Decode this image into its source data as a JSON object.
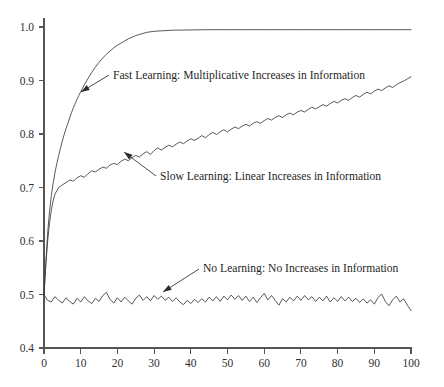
{
  "chart_data": {
    "type": "line",
    "title": "",
    "subtitle": "",
    "xlabel": "",
    "ylabel": "",
    "xlim": [
      0,
      100
    ],
    "ylim": [
      0.4,
      1.0
    ],
    "grid": false,
    "legend_position": "inline-annotations",
    "xticks": [
      0,
      10,
      20,
      30,
      40,
      50,
      60,
      70,
      80,
      90,
      100
    ],
    "xtick_labels": [
      "0",
      "10",
      "20",
      "30",
      "40",
      "50",
      "60",
      "70",
      "80",
      "90",
      "100"
    ],
    "yticks": [
      0.4,
      0.5,
      0.6,
      0.7,
      0.8,
      0.9,
      1.0
    ],
    "ytick_labels": [
      "0.4",
      "0.5",
      "0.6",
      "0.7",
      "0.8",
      "0.9",
      "1.0"
    ],
    "line_color": "#3a3a3a",
    "axis_color": "#555555",
    "background": "#ffffff",
    "series": [
      {
        "name": "Fast Learning: Multiplicative Increases in Information",
        "annotation": "Fast Learning: Multiplicative Increases in Information",
        "x": [
          0,
          0.5,
          1,
          1.5,
          2,
          2.5,
          3,
          3.5,
          4,
          4.5,
          5,
          5.5,
          6,
          6.5,
          7,
          7.5,
          8,
          8.5,
          9,
          9.5,
          10,
          11,
          12,
          13,
          14,
          15,
          16,
          17,
          18,
          19,
          20,
          21,
          22,
          23,
          24,
          25,
          26,
          27,
          28,
          30,
          35,
          40,
          45,
          50,
          55,
          60,
          65,
          70,
          75,
          80,
          85,
          90,
          95,
          100
        ],
        "y": [
          0.5,
          0.56,
          0.615,
          0.655,
          0.685,
          0.708,
          0.728,
          0.745,
          0.76,
          0.774,
          0.787,
          0.799,
          0.81,
          0.82,
          0.83,
          0.84,
          0.849,
          0.857,
          0.865,
          0.872,
          0.879,
          0.892,
          0.904,
          0.915,
          0.925,
          0.934,
          0.942,
          0.949,
          0.955,
          0.961,
          0.966,
          0.97,
          0.974,
          0.978,
          0.981,
          0.984,
          0.986,
          0.988,
          0.99,
          0.992,
          0.994,
          0.9945,
          0.995,
          0.995,
          0.995,
          0.995,
          0.995,
          0.995,
          0.995,
          0.995,
          0.995,
          0.995,
          0.995,
          0.995
        ]
      },
      {
        "name": "Slow Learning: Linear Increases in Information",
        "annotation": "Slow Learning: Linear Increases in Information",
        "x": [
          0,
          0.5,
          1,
          1.5,
          2,
          2.5,
          3,
          4,
          5,
          6,
          7,
          8,
          9,
          10,
          11,
          12,
          13,
          14,
          15,
          16,
          17,
          18,
          19,
          20,
          21,
          22,
          23,
          24,
          25,
          26,
          27,
          28,
          29,
          30,
          31,
          32,
          33,
          34,
          35,
          36,
          37,
          38,
          39,
          40,
          41,
          42,
          43,
          44,
          45,
          46,
          47,
          48,
          49,
          50,
          51,
          52,
          53,
          54,
          55,
          56,
          57,
          58,
          59,
          60,
          61,
          62,
          63,
          64,
          65,
          66,
          67,
          68,
          69,
          70,
          71,
          72,
          73,
          74,
          75,
          76,
          77,
          78,
          79,
          80,
          81,
          82,
          83,
          84,
          85,
          86,
          87,
          88,
          89,
          90,
          91,
          92,
          93,
          94,
          95,
          96,
          97,
          98,
          99,
          100
        ],
        "y": [
          0.5,
          0.556,
          0.6,
          0.633,
          0.658,
          0.675,
          0.688,
          0.7,
          0.705,
          0.709,
          0.714,
          0.712,
          0.718,
          0.722,
          0.719,
          0.726,
          0.731,
          0.729,
          0.734,
          0.738,
          0.736,
          0.742,
          0.745,
          0.743,
          0.749,
          0.753,
          0.75,
          0.756,
          0.76,
          0.757,
          0.763,
          0.767,
          0.762,
          0.769,
          0.774,
          0.77,
          0.775,
          0.779,
          0.776,
          0.781,
          0.785,
          0.782,
          0.787,
          0.791,
          0.788,
          0.792,
          0.797,
          0.793,
          0.799,
          0.803,
          0.799,
          0.804,
          0.808,
          0.804,
          0.809,
          0.813,
          0.81,
          0.815,
          0.818,
          0.815,
          0.82,
          0.823,
          0.82,
          0.825,
          0.829,
          0.826,
          0.831,
          0.834,
          0.831,
          0.836,
          0.839,
          0.836,
          0.841,
          0.844,
          0.841,
          0.846,
          0.85,
          0.847,
          0.851,
          0.855,
          0.852,
          0.857,
          0.861,
          0.858,
          0.863,
          0.866,
          0.863,
          0.868,
          0.872,
          0.869,
          0.874,
          0.878,
          0.875,
          0.88,
          0.884,
          0.881,
          0.886,
          0.89,
          0.887,
          0.892,
          0.896,
          0.899,
          0.903,
          0.907
        ]
      },
      {
        "name": "No Learning: No Increases in Information",
        "annotation": "No Learning: No Increases in Information",
        "x": [
          0,
          1,
          2,
          3,
          4,
          5,
          6,
          7,
          8,
          9,
          10,
          11,
          12,
          13,
          14,
          15,
          16,
          17,
          18,
          19,
          20,
          21,
          22,
          23,
          24,
          25,
          26,
          27,
          28,
          29,
          30,
          31,
          32,
          33,
          34,
          35,
          36,
          37,
          38,
          39,
          40,
          41,
          42,
          43,
          44,
          45,
          46,
          47,
          48,
          49,
          50,
          51,
          52,
          53,
          54,
          55,
          56,
          57,
          58,
          59,
          60,
          61,
          62,
          63,
          64,
          65,
          66,
          67,
          68,
          69,
          70,
          71,
          72,
          73,
          74,
          75,
          76,
          77,
          78,
          79,
          80,
          81,
          82,
          83,
          84,
          85,
          86,
          87,
          88,
          89,
          90,
          91,
          92,
          93,
          94,
          95,
          96,
          97,
          98,
          99,
          100
        ],
        "y": [
          0.5,
          0.489,
          0.486,
          0.496,
          0.489,
          0.484,
          0.494,
          0.487,
          0.482,
          0.493,
          0.486,
          0.496,
          0.488,
          0.483,
          0.493,
          0.487,
          0.498,
          0.504,
          0.491,
          0.484,
          0.494,
          0.486,
          0.495,
          0.488,
          0.482,
          0.493,
          0.499,
          0.489,
          0.496,
          0.488,
          0.498,
          0.491,
          0.497,
          0.489,
          0.495,
          0.487,
          0.494,
          0.486,
          0.481,
          0.489,
          0.483,
          0.491,
          0.485,
          0.492,
          0.486,
          0.495,
          0.488,
          0.496,
          0.487,
          0.497,
          0.49,
          0.499,
          0.491,
          0.498,
          0.489,
          0.497,
          0.487,
          0.495,
          0.485,
          0.494,
          0.502,
          0.49,
          0.498,
          0.489,
          0.48,
          0.492,
          0.486,
          0.495,
          0.488,
          0.497,
          0.489,
          0.498,
          0.49,
          0.496,
          0.487,
          0.495,
          0.488,
          0.497,
          0.486,
          0.494,
          0.487,
          0.496,
          0.488,
          0.495,
          0.487,
          0.493,
          0.485,
          0.492,
          0.484,
          0.49,
          0.482,
          0.494,
          0.501,
          0.487,
          0.479,
          0.49,
          0.497,
          0.486,
          0.492,
          0.48,
          0.47
        ]
      }
    ],
    "annotations": [
      {
        "id": "fast-learning-annotation",
        "text": "Fast Learning: Multiplicative Increases in Information",
        "text_x": 113,
        "text_y": 79,
        "leader_from_x": 109,
        "leader_from_y": 75,
        "leader_to_x": 81,
        "leader_to_y": 92
      },
      {
        "id": "slow-learning-annotation",
        "text": "Slow Learning: Linear Increases in Information",
        "text_x": 160,
        "text_y": 180,
        "leader_from_x": 156,
        "leader_from_y": 176,
        "leader_to_x": 124,
        "leader_to_y": 152
      },
      {
        "id": "no-learning-annotation",
        "text": "No Learning: No Increases in Information",
        "text_x": 203,
        "text_y": 272,
        "leader_from_x": 199,
        "leader_from_y": 269,
        "leader_to_x": 163,
        "leader_to_y": 292
      }
    ]
  }
}
